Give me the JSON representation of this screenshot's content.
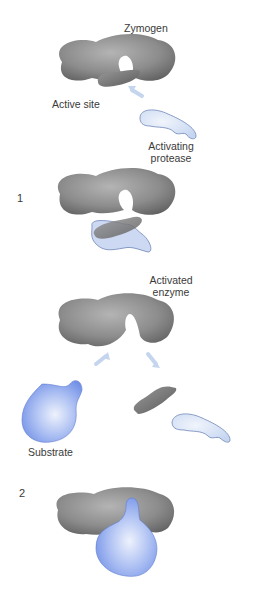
{
  "diagram": {
    "labels": {
      "zymogen": "Zymogen",
      "active_site": "Active site",
      "activating_protease_line1": "Activating",
      "activating_protease_line2": "protease",
      "activated_enzyme_line1": "Activated",
      "activated_enzyme_line2": "enzyme",
      "substrate": "Substrate"
    },
    "steps": [
      "1",
      "2"
    ],
    "colors": {
      "enzyme_gray": "#8a8a8a",
      "enzyme_dark": "#5e5e5e",
      "protease_fill": "#dbe6f7",
      "protease_edge": "#6f87b8",
      "substrate_fill": "#8aa6ee",
      "substrate_light": "#e4ebfb",
      "arrow": "#c5d5ee",
      "text": "#3a3a3a"
    }
  }
}
